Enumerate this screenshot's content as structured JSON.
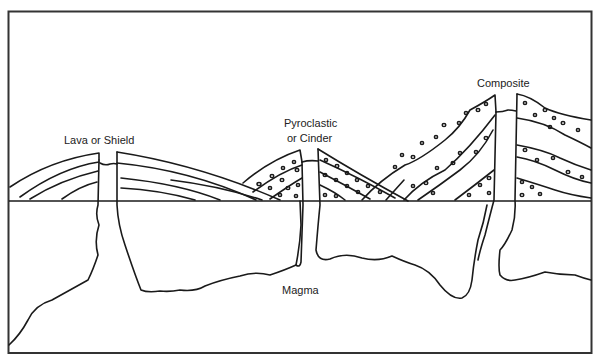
{
  "diagram": {
    "labels": {
      "shield": "Lava or Shield",
      "cinder_line1": "Pyroclastic",
      "cinder_line2": "or Cinder",
      "composite": "Composite",
      "magma": "Magma"
    },
    "volcanoes": [
      {
        "name": "Lava or Shield",
        "layers": "lava flows, gentle slopes"
      },
      {
        "name": "Pyroclastic or Cinder",
        "layers": "pyroclastic layers with fragments"
      },
      {
        "name": "Composite",
        "layers": "alternating lava and pyroclastic layers"
      }
    ],
    "colors": {
      "line": "#1a1a1a",
      "background": "#ffffff"
    }
  }
}
